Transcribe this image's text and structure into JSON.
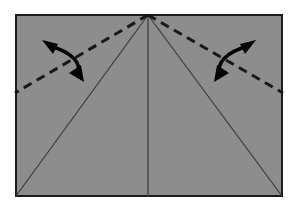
{
  "figure": {
    "background_color": "#ffffff"
  },
  "sheet": {
    "name": "paper-sheet",
    "fill_color": "#8d8d8d",
    "border_color": "#1c1c1c",
    "border_width": 2,
    "x": 15,
    "y": 14,
    "width": 268,
    "height": 183,
    "corners": {
      "top_left": [
        15,
        14
      ],
      "top_right": [
        283,
        14
      ],
      "bottom_right": [
        283,
        197
      ],
      "bottom_left": [
        15,
        197
      ]
    }
  },
  "apex": {
    "name": "apex-point",
    "x": 148,
    "y": 14,
    "label": "top centre apex"
  },
  "creases": {
    "color": "#3a3a3a",
    "width": 1,
    "lines": [
      {
        "name": "center-crease",
        "type": "vertical-crease",
        "from": [
          148,
          14
        ],
        "to": [
          148,
          197
        ]
      },
      {
        "name": "left-diagonal-crease",
        "type": "diagonal-crease",
        "from": [
          148,
          14
        ],
        "to": [
          16,
          196
        ]
      },
      {
        "name": "right-diagonal-crease",
        "type": "diagonal-crease",
        "from": [
          148,
          14
        ],
        "to": [
          282,
          196
        ]
      }
    ]
  },
  "fold_lines": {
    "color": "#181818",
    "width": 3,
    "dash_pattern": "9 6",
    "lines": [
      {
        "name": "left-valley-fold-line",
        "from": [
          148,
          14
        ],
        "to": [
          15,
          93
        ]
      },
      {
        "name": "right-valley-fold-line",
        "from": [
          148,
          14
        ],
        "to": [
          283,
          93
        ]
      }
    ]
  },
  "arrows": {
    "color": "#000000",
    "stroke_width": 3.4,
    "items": [
      {
        "name": "left-fold-arrow",
        "description": "double-headed curved arrow, upper head points up-left, lower head points down-right",
        "arc_start": [
          50,
          46
        ],
        "arc_control": [
          84,
          56
        ],
        "arc_end": [
          78,
          76
        ],
        "head_top_tip": [
          43,
          41
        ],
        "head_bottom_tip": [
          83,
          81
        ]
      },
      {
        "name": "right-fold-arrow",
        "description": "double-headed curved arrow, upper head points up-right, lower head points down-left",
        "arc_start": [
          248,
          46
        ],
        "arc_control": [
          214,
          56
        ],
        "arc_end": [
          220,
          76
        ],
        "head_top_tip": [
          255,
          41
        ],
        "head_bottom_tip": [
          215,
          81
        ]
      }
    ]
  }
}
